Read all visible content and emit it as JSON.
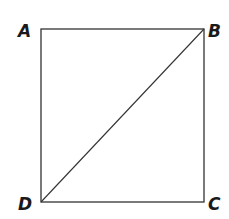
{
  "diagram": {
    "type": "square-with-diagonal",
    "vertices": [
      {
        "label": "A",
        "x": 41,
        "y": 29,
        "lx": 18,
        "ly": 37
      },
      {
        "label": "B",
        "x": 204,
        "y": 29,
        "lx": 208,
        "ly": 37
      },
      {
        "label": "C",
        "x": 204,
        "y": 202,
        "lx": 208,
        "ly": 210
      },
      {
        "label": "D",
        "x": 41,
        "y": 202,
        "lx": 18,
        "ly": 210
      }
    ],
    "edges": [
      [
        "A",
        "B"
      ],
      [
        "B",
        "C"
      ],
      [
        "C",
        "D"
      ],
      [
        "D",
        "A"
      ],
      [
        "D",
        "B"
      ]
    ],
    "stroke_color": "#333333"
  }
}
